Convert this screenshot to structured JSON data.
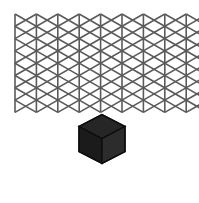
{
  "figure": {
    "width": 199,
    "height": 203,
    "background_color": "#ffffff"
  },
  "grid": {
    "name": "isometric-triangular-lattice",
    "line_color": "#5a5a5a",
    "line_width": 1.6,
    "origin_x": 15.0,
    "origin_y": 14.0,
    "cell_width": 21.4,
    "cell_height": 24.6,
    "columns": 9,
    "rows": 8,
    "line_families": [
      "vertical",
      "diagonal-down-right",
      "diagonal-up-right"
    ],
    "vertical_line_count": 9,
    "extent_left": 15,
    "extent_right": 186,
    "extent_top": 14,
    "extent_bottom": 190
  },
  "cube": {
    "name": "highlighted-unit-cube",
    "center_x": 102.0,
    "center_y": 138.6,
    "half_width": 23.0,
    "edge_rise": 11.9,
    "body_height": 25.0,
    "top_face_color": "#262626",
    "left_face_color": "#1b1b1b",
    "right_face_color": "#2c2c2c",
    "edge_color": "#0d0d0d",
    "edge_width": 1.4,
    "vertices": {
      "top": [
        102.0,
        114.6
      ],
      "upper_left": [
        79.0,
        126.5
      ],
      "upper_right": [
        125.0,
        126.5
      ],
      "center": [
        102.0,
        138.6
      ],
      "lower_left": [
        79.0,
        151.5
      ],
      "lower_right": [
        125.0,
        151.5
      ],
      "bottom": [
        102.0,
        163.4
      ]
    }
  }
}
